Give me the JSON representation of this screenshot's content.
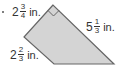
{
  "figure": {
    "type": "quadrilateral",
    "fill_color": "#d4d4d4",
    "stroke_color": "#666666",
    "right_angle_marker": true,
    "labels": [
      {
        "id": "top",
        "whole": "2",
        "num": "3",
        "den": "4",
        "unit": "in."
      },
      {
        "id": "right",
        "whole": "5",
        "num": "1",
        "den": "3",
        "unit": "in."
      },
      {
        "id": "left",
        "whole": "2",
        "num": "2",
        "den": "3",
        "unit": "in."
      }
    ]
  }
}
